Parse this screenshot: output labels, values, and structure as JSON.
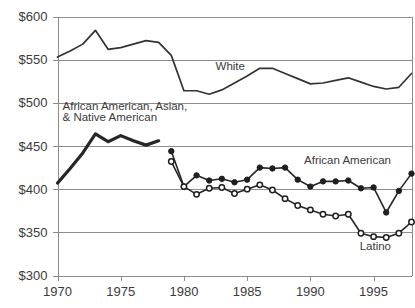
{
  "chart_data": {
    "type": "line",
    "title": "",
    "xlabel": "",
    "ylabel": "",
    "xlim": [
      1970,
      1998
    ],
    "ylim": [
      300,
      600
    ],
    "grid": true,
    "legend_position": "inline-annotations",
    "y_tick_labels": [
      "$600",
      "$550",
      "$500",
      "$450",
      "$400",
      "$350",
      "$300"
    ],
    "y_ticks": [
      600,
      550,
      500,
      450,
      400,
      350,
      300
    ],
    "x_tick_labels": [
      "1970",
      "1975",
      "1980",
      "1985",
      "1990",
      "1995"
    ],
    "x_ticks": [
      1970,
      1975,
      1980,
      1985,
      1990,
      1995
    ],
    "series": [
      {
        "name": "White",
        "label": "White",
        "marker": "none",
        "style": "thin-line",
        "x": [
          1970,
          1971,
          1972,
          1973,
          1974,
          1975,
          1976,
          1977,
          1978,
          1979,
          1980,
          1981,
          1982,
          1983,
          1984,
          1985,
          1986,
          1987,
          1988,
          1989,
          1990,
          1991,
          1992,
          1993,
          1994,
          1995,
          1996,
          1997,
          1998
        ],
        "values": [
          553,
          560,
          568,
          584,
          562,
          564,
          568,
          572,
          570,
          555,
          514,
          514,
          510,
          515,
          523,
          531,
          540,
          540,
          534,
          528,
          522,
          523,
          526,
          529,
          524,
          519,
          516,
          518,
          534
        ]
      },
      {
        "name": "African American, Asian, & Native American",
        "label": "African American, Asian, & Native American",
        "marker": "none",
        "style": "thick-line",
        "x": [
          1970,
          1971,
          1972,
          1973,
          1974,
          1975,
          1976,
          1977,
          1978
        ],
        "values": [
          407,
          424,
          442,
          464,
          455,
          462,
          456,
          451,
          456
        ]
      },
      {
        "name": "African American",
        "label": "African American",
        "marker": "filled-circle",
        "style": "marker-line",
        "x": [
          1979,
          1980,
          1981,
          1982,
          1983,
          1984,
          1985,
          1986,
          1987,
          1988,
          1989,
          1990,
          1991,
          1992,
          1993,
          1994,
          1995,
          1996,
          1997,
          1998
        ],
        "values": [
          444,
          403,
          416,
          410,
          412,
          408,
          411,
          425,
          424,
          425,
          411,
          403,
          409,
          409,
          410,
          401,
          402,
          373,
          398,
          418
        ]
      },
      {
        "name": "Latino",
        "label": "Latino",
        "marker": "open-circle",
        "style": "marker-line",
        "x": [
          1979,
          1980,
          1981,
          1982,
          1983,
          1984,
          1985,
          1986,
          1987,
          1988,
          1989,
          1990,
          1991,
          1992,
          1993,
          1994,
          1995,
          1996,
          1997,
          1998
        ],
        "values": [
          432,
          403,
          394,
          401,
          402,
          395,
          400,
          405,
          399,
          389,
          381,
          376,
          371,
          369,
          371,
          349,
          345,
          344,
          349,
          362
        ]
      }
    ],
    "annotations": [
      {
        "text": "White",
        "x_value": 1982.5,
        "y_value": 538
      },
      {
        "text": "African American, Asian,",
        "x_value": 1970.4,
        "y_value": 492
      },
      {
        "text": "& Native American",
        "x_value": 1970.4,
        "y_value": 479
      },
      {
        "text": "African American",
        "x_value": 1989.5,
        "y_value": 429
      },
      {
        "text": "Latino",
        "x_value": 1993.9,
        "y_value": 330
      }
    ]
  },
  "colors": {
    "line": "#262626",
    "grid": "#8c8c8c",
    "text": "#3b3b3b",
    "background": "#ffffff"
  }
}
